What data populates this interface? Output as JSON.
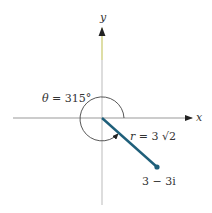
{
  "diagram": {
    "axes": {
      "x_label": "x",
      "y_label": "y"
    },
    "angle_label": {
      "symbol": "θ",
      "eq": " = ",
      "value": "315°"
    },
    "radius_label": {
      "symbol": "r",
      "eq": " = 3 ",
      "sqrt": "√2"
    },
    "point_label": "3 − 3i",
    "point": {
      "re": 3,
      "im": -3
    },
    "colors": {
      "vector": "#1f5f7a",
      "axis": "#999999",
      "y_arrow": "#c8c86a",
      "arc": "#444444"
    }
  }
}
